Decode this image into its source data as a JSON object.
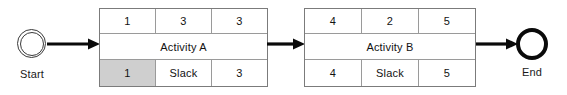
{
  "diagram": {
    "type": "activity-on-node-network",
    "start_node": {
      "label": "Start",
      "shape": "double-circle"
    },
    "end_node": {
      "label": "End",
      "shape": "thick-circle"
    },
    "connectors": [
      {
        "name": "start-to-activity-a",
        "style": "solid-arrow"
      },
      {
        "name": "activity-a-to-activity-b",
        "style": "solid-arrow"
      },
      {
        "name": "activity-b-to-end",
        "style": "solid-arrow"
      }
    ],
    "activities": [
      {
        "name": "Activity A",
        "top_row": [
          "1",
          "3",
          "3"
        ],
        "bottom_row": [
          "1",
          "Slack",
          "3"
        ],
        "shaded_cell_index": 0
      },
      {
        "name": "Activity B",
        "top_row": [
          "4",
          "2",
          "5"
        ],
        "bottom_row": [
          "4",
          "Slack",
          "5"
        ],
        "shaded_cell_index": null
      }
    ]
  },
  "colors": {
    "background": "#ffffff",
    "box_border": "#7b7b7b",
    "inner_border": "#9a9a9a",
    "text": "#121212",
    "shaded_cell": "#cfcfcf",
    "arrow": "#0a0a0a",
    "start_ring": "#3a3a3a",
    "end_ring": "#0a0a0a"
  }
}
